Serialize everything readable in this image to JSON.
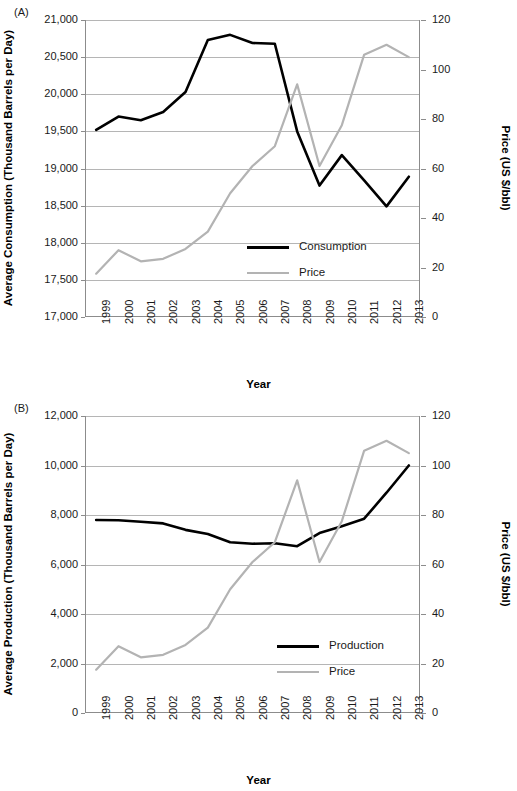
{
  "figure": {
    "panels": [
      {
        "letter": "(A)",
        "xlabel": "Year",
        "ylabel_left": "Average Consumption (Thousand Barrels per Day)",
        "ylabel_right": "Price (US $/bbl)",
        "left_ticks": [
          "17,000",
          "17,500",
          "18,000",
          "18,500",
          "19,000",
          "19,500",
          "20,000",
          "20,500",
          "21,000"
        ],
        "right_ticks": [
          "0",
          "20",
          "40",
          "60",
          "80",
          "100",
          "120"
        ],
        "x_ticks": [
          "1999",
          "2000",
          "2001",
          "2002",
          "2003",
          "2004",
          "2005",
          "2006",
          "2007",
          "2008",
          "2009",
          "2010",
          "2011",
          "2012",
          "2013"
        ],
        "legend": [
          {
            "label": "Consumption",
            "color": "#000000"
          },
          {
            "label": "Price",
            "color": "#b3b3b3"
          }
        ]
      },
      {
        "letter": "(B)",
        "xlabel": "Year",
        "ylabel_left": "Average Production (Thousand Barrels per Day)",
        "ylabel_right": "Price (US $/bbl)",
        "left_ticks": [
          "0",
          "2,000",
          "4,000",
          "6,000",
          "8,000",
          "10,000",
          "12,000"
        ],
        "right_ticks": [
          "0",
          "20",
          "40",
          "60",
          "80",
          "100",
          "120"
        ],
        "x_ticks": [
          "1999",
          "2000",
          "2001",
          "2002",
          "2003",
          "2004",
          "2005",
          "2006",
          "2007",
          "2008",
          "2009",
          "2010",
          "2011",
          "2012",
          "2013"
        ],
        "legend": [
          {
            "label": "Production",
            "color": "#000000"
          },
          {
            "label": "Price",
            "color": "#b3b3b3"
          }
        ]
      }
    ]
  },
  "chart_data": [
    {
      "type": "line",
      "panel": "(A)",
      "title": "",
      "xlabel": "Year",
      "ylabel": "Average Consumption (Thousand Barrels per Day)",
      "y2label": "Price (US $/bbl)",
      "x": [
        1999,
        2000,
        2001,
        2002,
        2003,
        2004,
        2005,
        2006,
        2007,
        2008,
        2009,
        2010,
        2011,
        2012,
        2013
      ],
      "ylim": [
        17000,
        21000
      ],
      "ytick_step": 500,
      "y2lim": [
        0,
        120
      ],
      "y2tick_step": 20,
      "grid": true,
      "legend_position": "center",
      "series": [
        {
          "name": "Consumption",
          "axis": "left",
          "color": "#000000",
          "values": [
            19520,
            19700,
            19650,
            19760,
            20030,
            20730,
            20800,
            20690,
            20680,
            19500,
            18770,
            19180,
            18840,
            18490,
            18890
          ]
        },
        {
          "name": "Price",
          "axis": "right",
          "color": "#b3b3b3",
          "values": [
            17.5,
            27.0,
            22.5,
            23.5,
            27.5,
            34.5,
            50.0,
            61.0,
            69.0,
            94.0,
            61.0,
            77.5,
            106.0,
            110.0,
            105.0
          ]
        }
      ]
    },
    {
      "type": "line",
      "panel": "(B)",
      "title": "",
      "xlabel": "Year",
      "ylabel": "Average Production (Thousand Barrels per Day)",
      "y2label": "Price (US $/bbl)",
      "x": [
        1999,
        2000,
        2001,
        2002,
        2003,
        2004,
        2005,
        2006,
        2007,
        2008,
        2009,
        2010,
        2011,
        2012,
        2013
      ],
      "ylim": [
        0,
        12000
      ],
      "ytick_step": 2000,
      "y2lim": [
        0,
        120
      ],
      "y2tick_step": 20,
      "grid": true,
      "legend_position": "center-right",
      "series": [
        {
          "name": "Production",
          "axis": "left",
          "color": "#000000",
          "values": [
            7800,
            7790,
            7730,
            7660,
            7400,
            7230,
            6900,
            6840,
            6860,
            6740,
            7270,
            7550,
            7850,
            8900,
            10000
          ]
        },
        {
          "name": "Price",
          "axis": "right",
          "color": "#b3b3b3",
          "values": [
            17.5,
            27.0,
            22.5,
            23.5,
            27.5,
            34.5,
            50.0,
            61.0,
            69.0,
            94.0,
            61.0,
            77.5,
            106.0,
            110.0,
            105.0
          ]
        }
      ]
    }
  ]
}
